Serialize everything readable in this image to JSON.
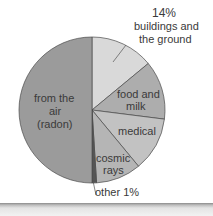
{
  "chart_data": {
    "type": "pie",
    "title": "",
    "start_angle_deg": 0,
    "direction": "clockwise",
    "slices": [
      {
        "label": "buildings and the ground",
        "value": 14,
        "value_label": "14%",
        "color": "#d9d9d9"
      },
      {
        "label": "food and milk",
        "value": 13,
        "color": "#adadad"
      },
      {
        "label": "medical",
        "value": 12,
        "color": "#c2c2c2"
      },
      {
        "label": "cosmic rays",
        "value": 10,
        "color": "#b5b5b5"
      },
      {
        "label": "other",
        "value": 1,
        "value_label": "1%",
        "color": "#555555"
      },
      {
        "label": "from the air (radon)",
        "value": 50,
        "color": "#9b9b9b"
      }
    ]
  },
  "labels": {
    "buildings_pct": "14%",
    "buildings_line1": "buildings and",
    "buildings_line2": "the ground",
    "food_line1": "food and",
    "food_line2": "milk",
    "medical": "medical",
    "cosmic_line1": "cosmic",
    "cosmic_line2": "rays",
    "radon_line1": "from the",
    "radon_line2": "air",
    "radon_line3": "(radon)",
    "other": "other 1%"
  }
}
